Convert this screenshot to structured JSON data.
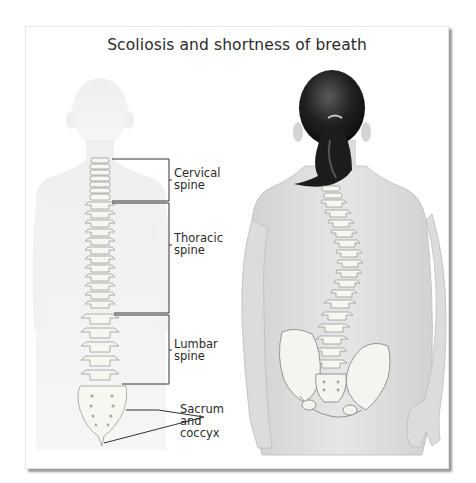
{
  "figure": {
    "title": "Scoliosis and shortness of breath"
  },
  "left_figure": {
    "description": "normal-spine-back-view",
    "labels": [
      {
        "line1": "Cervical",
        "line2": "spine"
      },
      {
        "line1": "Thoracic",
        "line2": "spine"
      },
      {
        "line1": "Lumbar",
        "line2": "spine"
      },
      {
        "line1": "Sacrum",
        "line2": "and",
        "line3": "coccyx"
      }
    ]
  },
  "right_figure": {
    "description": "scoliosis-curved-spine-back-view-with-ponytail"
  },
  "colors": {
    "text": "#2a2a2a",
    "bracket_line": "#333333",
    "body_ghost": "#eeeeee",
    "body_skin": "#dcdcdc",
    "bone": "#f7f7f2",
    "bone_outline": "#9a9a9a",
    "hair": "#1a1a1a",
    "frame_shadow": "#9a9a9a"
  }
}
